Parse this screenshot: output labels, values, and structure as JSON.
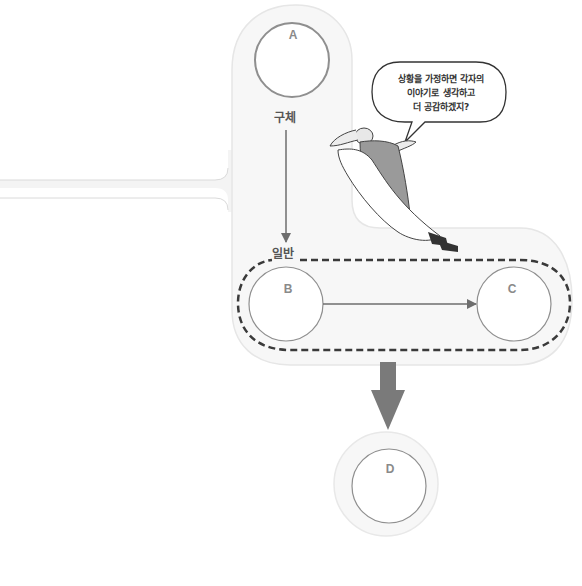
{
  "diagram": {
    "nodes": {
      "a": {
        "label": "A"
      },
      "b": {
        "label": "B"
      },
      "c": {
        "label": "C"
      },
      "d": {
        "label": "D"
      }
    },
    "labels": {
      "concrete": "구체",
      "general": "일반"
    },
    "speech_bubble": {
      "lines": [
        "상황을 가정하면 각자의",
        "이야기로 생각하고",
        "더 공감하겠지?"
      ]
    },
    "colors": {
      "panel_fill": "#f7f7f7",
      "panel_edge": "#e2e2e2",
      "circle_stroke": "#8f8f8f",
      "arrow": "#6e6e6e",
      "big_arrow": "#7a7a7a",
      "dashed": "#3a3a3a"
    }
  }
}
